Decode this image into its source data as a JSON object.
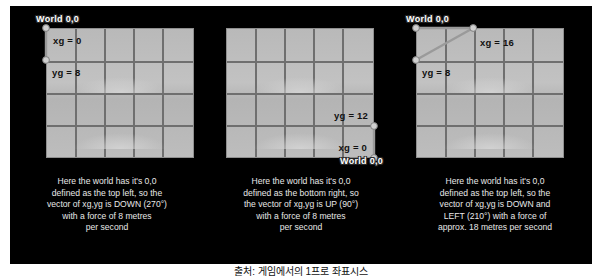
{
  "slide": {
    "background_color": "#000000",
    "grid": {
      "columns": 5,
      "rows": 4,
      "cell_color": "#bdbdbd",
      "line_color": "#6f6f6f"
    },
    "marker_color": "#b9b9b9",
    "vector_color": "#8a8a8a"
  },
  "panels": [
    {
      "id": "panel-top-left-origin",
      "world_label": "World 0,0",
      "axis_labels": [
        {
          "name": "xg",
          "text": "xg = 0"
        },
        {
          "name": "yg",
          "text": "yg = 8"
        }
      ],
      "caption": "Here the world has it's 0,0\ndefined as the top left, so the\nvector of xg,yg is DOWN (270°)\nwith a force of 8 metres\nper second"
    },
    {
      "id": "panel-bottom-right-origin",
      "world_label": "World 0,0",
      "axis_labels": [
        {
          "name": "yg",
          "text": "yg = 12"
        },
        {
          "name": "xg",
          "text": "xg = 0"
        }
      ],
      "caption": "Here the world has it's 0,0\ndefined as the bottom right, so\nthe vector of xg,yg is UP (90°)\nwith a force of 8 metres\nper second"
    },
    {
      "id": "panel-top-left-diagonal",
      "world_label": "World 0,0",
      "axis_labels": [
        {
          "name": "xg",
          "text": "xg = 16"
        },
        {
          "name": "yg",
          "text": "yg = 8"
        }
      ],
      "caption": "Here the world has it's 0,0\ndefined as the top left, so the\nvector of xg,yg is DOWN and\nLEFT (210°) with a force of\napprox. 18 metres per second"
    }
  ],
  "footer": {
    "text": "출처: 게임에서의 1프로 좌표시스"
  }
}
